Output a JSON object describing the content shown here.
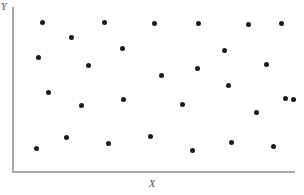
{
  "chart": {
    "type": "scatter",
    "title": "",
    "xlabel": "X",
    "ylabel": "Y",
    "axis_color": "#a8a8a8",
    "point_color": "#1a1a1a",
    "point_count": 28
  },
  "chart_data": {
    "type": "scatter",
    "title": "",
    "subtitle": "",
    "xlabel": "X",
    "ylabel": "Y",
    "xtick_labels": [],
    "ytick_labels": [],
    "grid": false,
    "legend": null,
    "annotations": [],
    "xlim": [
      0,
      100
    ],
    "ylim": [
      0,
      100
    ],
    "series": [
      {
        "name": "observations",
        "color": "#1a1a1a",
        "marker": "circle",
        "points_px": [
          {
            "x": 42,
            "y": 22
          },
          {
            "x": 104,
            "y": 22
          },
          {
            "x": 154,
            "y": 23
          },
          {
            "x": 198,
            "y": 23
          },
          {
            "x": 248,
            "y": 24
          },
          {
            "x": 281,
            "y": 23
          },
          {
            "x": 71,
            "y": 37
          },
          {
            "x": 38,
            "y": 57
          },
          {
            "x": 122,
            "y": 48
          },
          {
            "x": 224,
            "y": 50
          },
          {
            "x": 88,
            "y": 65
          },
          {
            "x": 197,
            "y": 68
          },
          {
            "x": 266,
            "y": 64
          },
          {
            "x": 161,
            "y": 75
          },
          {
            "x": 48,
            "y": 92
          },
          {
            "x": 228,
            "y": 85
          },
          {
            "x": 285,
            "y": 98
          },
          {
            "x": 123,
            "y": 99
          },
          {
            "x": 81,
            "y": 105
          },
          {
            "x": 182,
            "y": 104
          },
          {
            "x": 293,
            "y": 99
          },
          {
            "x": 256,
            "y": 112
          },
          {
            "x": 66,
            "y": 137
          },
          {
            "x": 150,
            "y": 136
          },
          {
            "x": 231,
            "y": 142
          },
          {
            "x": 36,
            "y": 148
          },
          {
            "x": 108,
            "y": 143
          },
          {
            "x": 192,
            "y": 150
          },
          {
            "x": 273,
            "y": 146
          }
        ],
        "x": [
          10.6,
          32.5,
          50.2,
          65.7,
          83.4,
          95.1,
          20.8,
          9.2,
          38.9,
          74.9,
          26.9,
          65.4,
          89.8,
          52.7,
          12.7,
          76.3,
          96.5,
          39.2,
          24.4,
          60.1,
          99.3,
          86.2,
          19.1,
          48.8,
          77.4,
          8.5,
          33.9,
          63.6,
          92.2
        ],
        "y": [
          90.2,
          90.2,
          89.6,
          89.6,
          89.0,
          89.6,
          80.5,
          68.4,
          74.0,
          72.8,
          63.7,
          61.9,
          64.3,
          56.8,
          47.6,
          52.0,
          44.1,
          43.5,
          39.9,
          40.5,
          43.5,
          35.7,
          20.4,
          21.0,
          17.4,
          13.8,
          16.8,
          12.6,
          15.0
        ]
      }
    ]
  }
}
